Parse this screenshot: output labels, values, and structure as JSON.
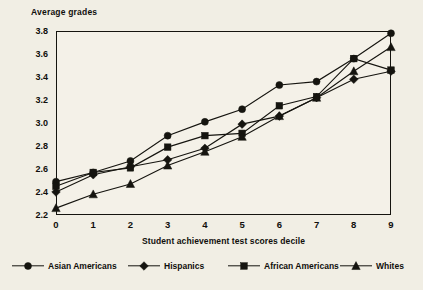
{
  "chart_data": {
    "type": "line",
    "title": "Average grades",
    "ylabel": "Average grades",
    "xlabel": "Student achievement test scores decile",
    "x": [
      0,
      1,
      2,
      3,
      4,
      5,
      6,
      7,
      8,
      9
    ],
    "xticklabels": [
      "0",
      "1",
      "2",
      "3",
      "4",
      "5",
      "6",
      "7",
      "8",
      "9"
    ],
    "yticklabels": [
      "3.8",
      "3.6",
      "3.4",
      "3.2",
      "3.0",
      "2.8",
      "2.6",
      "2.4",
      "2.2"
    ],
    "yticks": [
      3.8,
      3.6,
      3.4,
      3.2,
      3.0,
      2.8,
      2.6,
      2.4,
      2.2
    ],
    "ylim": [
      2.2,
      3.8
    ],
    "xlim": [
      0,
      9
    ],
    "grid": false,
    "legend_position": "bottom",
    "series": [
      {
        "name": "Asian Americans",
        "marker": "circle",
        "values": [
          2.49,
          2.57,
          2.67,
          2.89,
          3.01,
          3.12,
          3.33,
          3.36,
          3.56,
          3.78
        ]
      },
      {
        "name": "Hispanics",
        "marker": "diamond",
        "values": [
          2.4,
          2.55,
          2.62,
          2.68,
          2.78,
          2.99,
          3.06,
          3.22,
          3.38,
          3.45
        ]
      },
      {
        "name": "African Americans",
        "marker": "square",
        "values": [
          2.45,
          2.57,
          2.61,
          2.79,
          2.89,
          2.91,
          3.15,
          3.23,
          3.56,
          3.46
        ]
      },
      {
        "name": "Whites",
        "marker": "triangle",
        "values": [
          2.26,
          2.38,
          2.47,
          2.63,
          2.75,
          2.88,
          3.06,
          3.22,
          3.45,
          3.66
        ]
      }
    ],
    "colors": {
      "ink": "#15140f",
      "background": "#f1eee4",
      "plot_background": "#f4f1e8"
    }
  }
}
